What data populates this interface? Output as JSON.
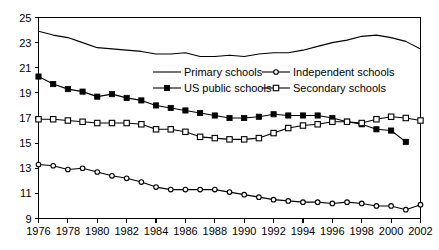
{
  "chart_data": {
    "type": "line",
    "title": "",
    "xlabel": "",
    "ylabel": "",
    "xlim": [
      1976,
      2002
    ],
    "ylim": [
      9,
      25
    ],
    "ytick_step": 2,
    "xtick_step": 2,
    "grid": false,
    "legend_position": "inside-upper-center",
    "x": [
      1976,
      1977,
      1978,
      1979,
      1980,
      1981,
      1982,
      1983,
      1984,
      1985,
      1986,
      1987,
      1988,
      1989,
      1990,
      1991,
      1992,
      1993,
      1994,
      1995,
      1996,
      1997,
      1998,
      1999,
      2000,
      2001,
      2002
    ],
    "xtick_labels": [
      "1976",
      "1978",
      "1980",
      "1982",
      "1984",
      "1986",
      "1988",
      "1990",
      "1992",
      "1994",
      "1996",
      "1998",
      "2000",
      "2002"
    ],
    "ytick_labels": [
      "9",
      "11",
      "13",
      "15",
      "17",
      "19",
      "21",
      "23",
      "25"
    ],
    "series": [
      {
        "name": "Primary schools",
        "marker": "none",
        "values": [
          23.9,
          23.6,
          23.4,
          23.0,
          22.6,
          22.5,
          22.4,
          22.3,
          22.1,
          22.1,
          22.2,
          21.9,
          21.9,
          22.0,
          21.9,
          22.1,
          22.2,
          22.2,
          22.4,
          22.7,
          23.0,
          23.2,
          23.5,
          23.6,
          23.4,
          23.1,
          22.5
        ]
      },
      {
        "name": "US public schools",
        "marker": "filled-square",
        "values": [
          20.3,
          19.7,
          19.3,
          19.1,
          18.7,
          18.9,
          18.6,
          18.4,
          18.0,
          17.8,
          17.6,
          17.4,
          17.2,
          17.0,
          17.0,
          17.1,
          17.3,
          17.2,
          17.2,
          17.2,
          17.0,
          16.7,
          16.5,
          16.1,
          16.0,
          15.1,
          null
        ]
      },
      {
        "name": "Secondary schools",
        "marker": "open-square",
        "values": [
          16.9,
          16.9,
          16.8,
          16.7,
          16.6,
          16.6,
          16.6,
          16.5,
          16.1,
          16.1,
          15.9,
          15.5,
          15.4,
          15.3,
          15.3,
          15.4,
          15.8,
          16.2,
          16.4,
          16.5,
          16.7,
          16.7,
          16.6,
          16.9,
          17.1,
          17.0,
          16.8
        ]
      },
      {
        "name": "Independent schools",
        "marker": "open-circle",
        "values": [
          13.3,
          13.2,
          12.9,
          13.0,
          12.7,
          12.4,
          12.2,
          11.9,
          11.5,
          11.3,
          11.3,
          11.3,
          11.3,
          11.1,
          10.9,
          10.7,
          10.5,
          10.4,
          10.3,
          10.3,
          10.2,
          10.3,
          10.2,
          10.0,
          10.0,
          9.7,
          10.1
        ]
      }
    ]
  },
  "legend": {
    "entries": [
      {
        "label": "Primary schools"
      },
      {
        "label": "Independent schools"
      },
      {
        "label": "US public schools"
      },
      {
        "label": "Secondary schools"
      }
    ]
  }
}
